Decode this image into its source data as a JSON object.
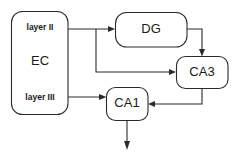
{
  "diagram": {
    "stroke_color": "#2b2b2b",
    "background_color": "#ffffff",
    "nodes": [
      {
        "id": "ec",
        "label": "EC",
        "sub_labels": [
          "layer II",
          "layer III"
        ]
      },
      {
        "id": "dg",
        "label": "DG"
      },
      {
        "id": "ca3",
        "label": "CA3"
      },
      {
        "id": "ca1",
        "label": "CA1"
      }
    ],
    "edges": [
      {
        "id": "ec-layer2-to-dg",
        "from": "EC layer II",
        "to": "DG"
      },
      {
        "id": "ec-layer2-to-ca3",
        "from": "EC layer II",
        "to": "CA3"
      },
      {
        "id": "dg-to-ca3",
        "from": "DG",
        "to": "CA3"
      },
      {
        "id": "ca3-to-ca1",
        "from": "CA3",
        "to": "CA1"
      },
      {
        "id": "ec-layer3-to-ca1",
        "from": "EC layer III",
        "to": "CA1"
      },
      {
        "id": "ca1-output",
        "from": "CA1",
        "to": "output"
      }
    ]
  }
}
